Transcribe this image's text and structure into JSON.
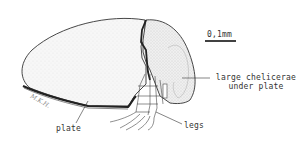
{
  "figure": {
    "scale_bar": {
      "label": "0,1mm"
    },
    "labels": {
      "chelicerae_line1": "large chelicerae",
      "chelicerae_line2": "under plate",
      "plate": "plate",
      "legs": "legs"
    },
    "signature": "M.K.H."
  }
}
